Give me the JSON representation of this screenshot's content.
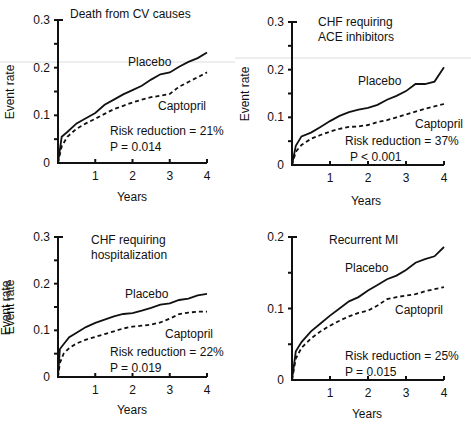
{
  "figure": {
    "panels": [
      {
        "id": "death-cv",
        "title_lines": [
          "Death from CV causes"
        ],
        "ylabel": "Event rate",
        "xlabel": "Years",
        "y_ticks": [
          "0",
          "0.1",
          "0.2",
          "0.3"
        ],
        "x_ticks": [
          "1",
          "2",
          "3",
          "4"
        ],
        "placebo_label": "Placebo",
        "captopril_label": "Captopril",
        "risk_reduction": "Risk reduction = 21%",
        "p_value": "P = 0.014"
      },
      {
        "id": "chf-ace",
        "title_lines": [
          "CHF requiring",
          "ACE inhibitors"
        ],
        "ylabel": "Event rate",
        "xlabel": "Years",
        "y_ticks": [
          "0",
          "0.1",
          "0.2",
          "0.3"
        ],
        "x_ticks": [
          "1",
          "2",
          "3",
          "4"
        ],
        "placebo_label": "Placebo",
        "captopril_label": "Captopril",
        "risk_reduction": "Risk reduction = 37%",
        "p_value": "P < 0.001"
      },
      {
        "id": "chf-hosp",
        "title_lines": [
          "CHF requiring",
          "hospitalization"
        ],
        "ylabel": "Event rate",
        "xlabel": "Years",
        "y_ticks": [
          "0",
          "0.1",
          "0.2",
          "0.3"
        ],
        "x_ticks": [
          "1",
          "2",
          "3",
          "4"
        ],
        "placebo_label": "Placebo",
        "captopril_label": "Captopril",
        "risk_reduction": "Risk reduction = 22%",
        "p_value": "P = 0.019"
      },
      {
        "id": "recurrent-mi",
        "title_lines": [
          "Recurrent MI"
        ],
        "ylabel": "Event rate",
        "xlabel": "Years",
        "y_ticks": [
          "0",
          "0.1",
          "0.2"
        ],
        "x_ticks": [
          "1",
          "2",
          "3",
          "4"
        ],
        "placebo_label": "Placebo",
        "captopril_label": "Captopril",
        "risk_reduction": "Risk reduction = 25%",
        "p_value": "P = 0.015"
      }
    ]
  },
  "chart_data": [
    {
      "type": "line",
      "title": "Death from CV causes",
      "xlabel": "Years",
      "ylabel": "Event rate",
      "xlim": [
        0,
        4
      ],
      "ylim": [
        0,
        0.3
      ],
      "x_ticks": [
        1,
        2,
        3,
        4
      ],
      "y_ticks": [
        0,
        0.1,
        0.2,
        0.3
      ],
      "grid": false,
      "x": [
        0,
        0.1,
        0.25,
        0.5,
        0.75,
        1,
        1.25,
        1.5,
        1.75,
        2,
        2.25,
        2.5,
        2.75,
        3,
        3.25,
        3.5,
        3.75,
        4
      ],
      "series": [
        {
          "name": "Placebo",
          "style": "solid",
          "values": [
            0,
            0.055,
            0.065,
            0.083,
            0.094,
            0.105,
            0.122,
            0.133,
            0.144,
            0.153,
            0.162,
            0.175,
            0.186,
            0.19,
            0.202,
            0.212,
            0.22,
            0.232
          ]
        },
        {
          "name": "Captopril",
          "style": "dashed",
          "values": [
            0,
            0.035,
            0.055,
            0.072,
            0.083,
            0.093,
            0.103,
            0.113,
            0.12,
            0.127,
            0.133,
            0.138,
            0.141,
            0.145,
            0.16,
            0.17,
            0.18,
            0.19
          ]
        }
      ],
      "annotations": [
        "Risk reduction = 21%",
        "P = 0.014"
      ]
    },
    {
      "type": "line",
      "title": "CHF requiring ACE inhibitors",
      "xlabel": "Years",
      "ylabel": "Event rate",
      "xlim": [
        0,
        4
      ],
      "ylim": [
        0,
        0.3
      ],
      "x_ticks": [
        1,
        2,
        3,
        4
      ],
      "y_ticks": [
        0,
        0.1,
        0.2,
        0.3
      ],
      "grid": false,
      "x": [
        0,
        0.1,
        0.25,
        0.5,
        0.75,
        1,
        1.25,
        1.5,
        1.75,
        2,
        2.25,
        2.5,
        2.75,
        3,
        3.25,
        3.5,
        3.75,
        4
      ],
      "series": [
        {
          "name": "Placebo",
          "style": "solid",
          "values": [
            0,
            0.04,
            0.06,
            0.068,
            0.08,
            0.092,
            0.103,
            0.111,
            0.116,
            0.12,
            0.126,
            0.137,
            0.145,
            0.155,
            0.17,
            0.17,
            0.175,
            0.205
          ]
        },
        {
          "name": "Captopril",
          "style": "dashed",
          "values": [
            0,
            0.028,
            0.042,
            0.055,
            0.063,
            0.07,
            0.076,
            0.08,
            0.081,
            0.084,
            0.09,
            0.094,
            0.1,
            0.106,
            0.112,
            0.118,
            0.123,
            0.128
          ]
        }
      ],
      "annotations": [
        "Risk reduction = 37%",
        "P < 0.001"
      ]
    },
    {
      "type": "line",
      "title": "CHF requiring hospitalization",
      "xlabel": "Years",
      "ylabel": "Event rate",
      "xlim": [
        0,
        4
      ],
      "ylim": [
        0,
        0.3
      ],
      "x_ticks": [
        1,
        2,
        3,
        4
      ],
      "y_ticks": [
        0,
        0.1,
        0.2,
        0.3
      ],
      "grid": false,
      "x": [
        0,
        0.05,
        0.15,
        0.3,
        0.5,
        0.75,
        1,
        1.25,
        1.5,
        1.75,
        2,
        2.25,
        2.5,
        2.75,
        3,
        3.25,
        3.5,
        3.75,
        4
      ],
      "series": [
        {
          "name": "Placebo",
          "style": "solid",
          "values": [
            0,
            0.06,
            0.07,
            0.085,
            0.095,
            0.107,
            0.116,
            0.123,
            0.13,
            0.135,
            0.137,
            0.142,
            0.148,
            0.155,
            0.158,
            0.165,
            0.168,
            0.175,
            0.178
          ]
        },
        {
          "name": "Captopril",
          "style": "dashed",
          "values": [
            0,
            0.03,
            0.05,
            0.062,
            0.072,
            0.08,
            0.086,
            0.092,
            0.098,
            0.104,
            0.108,
            0.11,
            0.112,
            0.117,
            0.125,
            0.135,
            0.138,
            0.14,
            0.14
          ]
        }
      ],
      "annotations": [
        "Risk reduction = 22%",
        "P = 0.019"
      ]
    },
    {
      "type": "line",
      "title": "Recurrent MI",
      "xlabel": "Years",
      "ylabel": "Event rate",
      "xlim": [
        0,
        4
      ],
      "ylim": [
        0,
        0.2
      ],
      "x_ticks": [
        1,
        2,
        3,
        4
      ],
      "y_ticks": [
        0,
        0.1,
        0.2
      ],
      "grid": false,
      "x": [
        0,
        0.1,
        0.25,
        0.5,
        0.75,
        1,
        1.25,
        1.5,
        1.75,
        2,
        2.25,
        2.5,
        2.75,
        3,
        3.25,
        3.5,
        3.75,
        4
      ],
      "series": [
        {
          "name": "Placebo",
          "style": "solid",
          "values": [
            0,
            0.04,
            0.053,
            0.068,
            0.079,
            0.09,
            0.1,
            0.11,
            0.116,
            0.125,
            0.133,
            0.141,
            0.146,
            0.154,
            0.164,
            0.169,
            0.173,
            0.186
          ]
        },
        {
          "name": "Captopril",
          "style": "dashed",
          "values": [
            0,
            0.03,
            0.045,
            0.058,
            0.068,
            0.076,
            0.083,
            0.089,
            0.094,
            0.097,
            0.104,
            0.113,
            0.116,
            0.118,
            0.12,
            0.124,
            0.127,
            0.13
          ]
        }
      ],
      "annotations": [
        "Risk reduction = 25%",
        "P = 0.015"
      ]
    }
  ]
}
